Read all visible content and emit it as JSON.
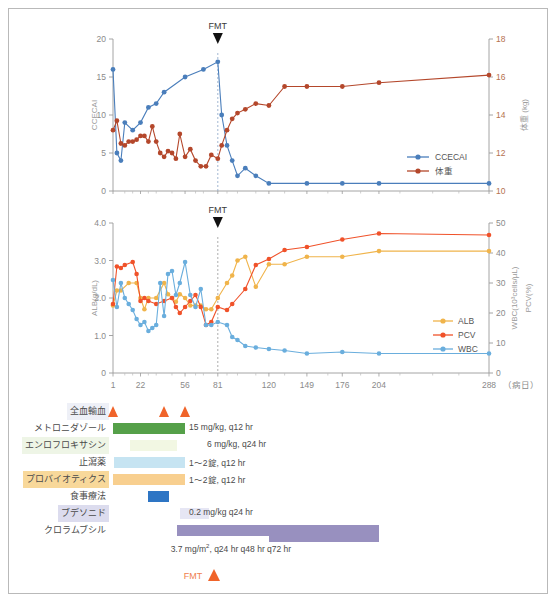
{
  "figure": {
    "xaxis_unit_label": "（病日）",
    "fmt_label": "FMT"
  },
  "chart_data": [
    {
      "type": "line",
      "title": "",
      "xlabel": "",
      "ylabel": "CCECAI",
      "y2label": "体重 (kg)",
      "ylim": [
        0,
        20
      ],
      "y2lim": [
        10,
        18
      ],
      "yticks": [
        0,
        5,
        10,
        15,
        20
      ],
      "y2ticks": [
        10,
        12,
        14,
        16,
        18
      ],
      "xticks": [
        1,
        22,
        56,
        81,
        120,
        149,
        176,
        204,
        288
      ],
      "xlim": [
        1,
        288
      ],
      "grid": false,
      "legend_position": "bottom-right",
      "annotations": [
        {
          "text": "FMT",
          "x": 81
        }
      ],
      "series": [
        {
          "name": "CCECAI",
          "color": "#4a7ebb",
          "axis": "left",
          "x": [
            1,
            4,
            7,
            10,
            16,
            22,
            28,
            34,
            40,
            56,
            70,
            81,
            84,
            88,
            92,
            96,
            102,
            110,
            120,
            149,
            176,
            204,
            288
          ],
          "values": [
            16,
            5,
            4,
            9,
            8,
            9,
            11,
            11.5,
            13,
            15,
            16,
            17,
            10,
            6,
            4,
            2,
            3,
            2,
            1,
            1,
            1,
            1,
            1
          ]
        },
        {
          "name": "体重",
          "color": "#b4472b",
          "axis": "right",
          "x": [
            1,
            4,
            7,
            10,
            13,
            16,
            19,
            22,
            25,
            28,
            31,
            34,
            37,
            40,
            43,
            46,
            49,
            52,
            56,
            60,
            64,
            68,
            72,
            76,
            81,
            84,
            88,
            92,
            96,
            102,
            110,
            120,
            132,
            149,
            176,
            204,
            288
          ],
          "values": [
            13.2,
            13.7,
            12.5,
            12.4,
            12.6,
            12.6,
            12.7,
            12.9,
            12.9,
            12.6,
            13.4,
            12.6,
            12.0,
            11.8,
            12.1,
            12.0,
            11.7,
            13.0,
            11.8,
            12.2,
            11.6,
            11.3,
            11.3,
            11.9,
            11.7,
            12.4,
            13.2,
            13.8,
            14.1,
            14.3,
            14.6,
            14.5,
            15.5,
            15.5,
            15.5,
            15.7,
            16.1
          ]
        }
      ]
    },
    {
      "type": "line",
      "title": "",
      "xlabel": "（病日）",
      "ylabel": "ALB(g/dL)",
      "y2label_pcv": "PCV(%)",
      "y2label_wbc": "WBC(10³cells/µL)",
      "ylim": [
        0,
        4.0
      ],
      "y2lim": [
        0,
        50
      ],
      "yticks": [
        "0",
        "1.0",
        "2.0",
        "3.0",
        "4.0"
      ],
      "y2ticks": [
        0,
        10,
        20,
        30,
        40,
        50
      ],
      "xticks": [
        1,
        22,
        56,
        81,
        120,
        149,
        176,
        204,
        288
      ],
      "xlim": [
        1,
        288
      ],
      "grid": false,
      "legend_position": "right",
      "annotations": [
        {
          "text": "FMT",
          "x": 81
        }
      ],
      "series": [
        {
          "name": "ALB",
          "color": "#f0b44b",
          "axis": "left",
          "unit": "g/dL",
          "x": [
            1,
            4,
            7,
            13,
            19,
            22,
            25,
            28,
            34,
            40,
            43,
            46,
            49,
            52,
            56,
            60,
            64,
            68,
            72,
            76,
            81,
            88,
            92,
            96,
            102,
            110,
            120,
            132,
            149,
            176,
            204,
            288
          ],
          "values": [
            1.8,
            2.2,
            2.2,
            2.4,
            2.4,
            2.0,
            1.7,
            2.0,
            2.0,
            2.4,
            2.1,
            2.0,
            1.9,
            2.1,
            2.0,
            1.8,
            1.8,
            1.8,
            1.7,
            1.7,
            2.0,
            2.4,
            2.6,
            3.0,
            3.1,
            2.3,
            2.9,
            2.9,
            3.1,
            3.1,
            3.25,
            3.25
          ]
        },
        {
          "name": "PCV",
          "color": "#f0522a",
          "axis": "right",
          "unit": "%",
          "x": [
            1,
            4,
            7,
            10,
            16,
            19,
            22,
            25,
            28,
            34,
            40,
            46,
            49,
            52,
            56,
            60,
            64,
            68,
            72,
            76,
            81,
            88,
            92,
            102,
            110,
            120,
            132,
            149,
            176,
            204,
            288
          ],
          "values": [
            23,
            35.5,
            35,
            36,
            37,
            33,
            24,
            25,
            24,
            23,
            24,
            25,
            22,
            20,
            22,
            24,
            26,
            22,
            16,
            17,
            22,
            21,
            23,
            28,
            36,
            38,
            41,
            42,
            44.5,
            46.5,
            46
          ]
        },
        {
          "name": "WBC",
          "color": "#6aaedd",
          "axis": "right",
          "unit": "10³cells/µL",
          "x": [
            1,
            4,
            7,
            10,
            13,
            16,
            19,
            22,
            25,
            28,
            31,
            34,
            37,
            40,
            43,
            46,
            49,
            52,
            56,
            60,
            64,
            68,
            72,
            76,
            81,
            88,
            92,
            96,
            102,
            110,
            120,
            132,
            149,
            176,
            204,
            288
          ],
          "values": [
            31,
            22,
            30,
            25,
            23,
            21,
            18,
            16,
            17,
            14,
            15,
            16,
            30,
            19,
            33,
            34,
            26,
            30,
            37,
            26,
            22,
            28,
            16,
            16,
            17,
            16,
            12,
            11,
            9,
            8.5,
            8,
            7.5,
            6.5,
            7,
            6.5,
            6.5
          ]
        }
      ]
    }
  ],
  "treatments": {
    "rows": [
      {
        "label": "全血輸血",
        "label_bg": "#eef0f7",
        "bar_color": "",
        "dose": "",
        "events": [
          1,
          40,
          56
        ]
      },
      {
        "label": "メトロニダゾール",
        "label_bg": "#ffffff",
        "bar_color": "#55a049",
        "dose": "15 mg/kg, q12 hr",
        "start": 1,
        "end": 56
      },
      {
        "label": "エンロフロキサシン",
        "label_bg": "#eef5e6",
        "bar_color": "#f2f7e3",
        "dose": "6 mg/kg, q24 hr",
        "start": 14,
        "end": 50
      },
      {
        "label": "止瀉薬",
        "label_bg": "#ffffff",
        "bar_color": "#c6e4f2",
        "dose": "1〜2錠, q12 hr",
        "start": 2,
        "end": 56
      },
      {
        "label": "プロバイオティクス",
        "label_bg": "#f8d89a",
        "bar_color": "#f8cf8f",
        "dose": "1〜2錠, q12 hr",
        "start": 1,
        "end": 56
      },
      {
        "label": "食事療法",
        "label_bg": "#ffffff",
        "bar_color": "#2e75c4",
        "dose": "",
        "start": 28,
        "end": 44
      },
      {
        "label": "ブデソニド",
        "label_bg": "#dcdcee",
        "bar_color": "#e6e6f4",
        "dose": "0.2 mg/kg q24 hr",
        "start": 52,
        "end": 74
      },
      {
        "label": "クロラムブシル",
        "label_bg": "#ffffff",
        "bar_color": "#9890bf",
        "dose": "",
        "start": 50,
        "end": 204
      }
    ],
    "chlorambucil_dose": "3.7 mg/m2, q24 hr q48 hr q72 hr",
    "chlorambucil_dose_prefix": "3.7 mg/m",
    "chlorambucil_dose_sup": "2",
    "chlorambucil_dose_suffix": ", q24 hr q48 hr q72 hr",
    "footer_fmt_label": "FMT"
  }
}
